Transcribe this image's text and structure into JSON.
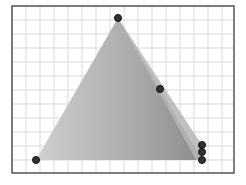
{
  "diagram": {
    "frame": {
      "x": 12,
      "y": 6,
      "width": 222,
      "height": 167,
      "stroke": "#555555"
    },
    "grid": {
      "spacing": 14,
      "origin_x": 12,
      "origin_y": 6,
      "color": "#d9d9d9"
    },
    "shape": {
      "type": "triangle",
      "fill_light": "#c8c8c8",
      "fill_dark": "#8f8f8f",
      "vertices": [
        {
          "name": "apex",
          "x": 118,
          "y": 18
        },
        {
          "name": "bottom-left",
          "x": 36,
          "y": 160
        },
        {
          "name": "bottom-right",
          "x": 202,
          "y": 160
        }
      ],
      "side_face": [
        {
          "x": 118,
          "y": 18
        },
        {
          "x": 202,
          "y": 145
        },
        {
          "x": 202,
          "y": 160
        },
        {
          "x": 196,
          "y": 160
        }
      ]
    },
    "points": [
      {
        "name": "apex-point",
        "x": 118,
        "y": 18
      },
      {
        "name": "edge-point",
        "x": 160,
        "y": 89
      },
      {
        "name": "bottom-left-point",
        "x": 36,
        "y": 160
      },
      {
        "name": "bottom-right-point-1",
        "x": 202,
        "y": 145
      },
      {
        "name": "bottom-right-point-2",
        "x": 202,
        "y": 152
      },
      {
        "name": "bottom-right-point-3",
        "x": 202,
        "y": 160
      }
    ],
    "point_style": {
      "radius": 3.5,
      "fill": "#333333",
      "stroke": "#111111"
    }
  }
}
